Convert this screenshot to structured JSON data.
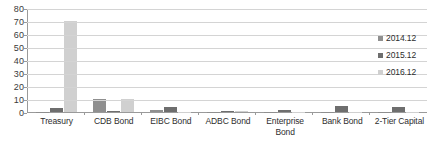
{
  "chart_data": {
    "type": "bar",
    "title": "",
    "subtitle": "",
    "xlabel": "",
    "ylabel": "",
    "ylim": [
      0,
      80
    ],
    "ytick_step": 10,
    "yticks": [
      "0",
      "10",
      "20",
      "30",
      "40",
      "50",
      "60",
      "70",
      "80"
    ],
    "grid": true,
    "legend_position": "right",
    "categories": [
      "Treasury",
      "CDB Bond",
      "EIBC Bond",
      "ADBC Bond",
      "Enterprise Bond",
      "Bank Bond",
      "2-Tier Capital"
    ],
    "series": [
      {
        "name": "2014.12",
        "color": "#8f8f8f",
        "values": [
          0.3,
          9.8,
          1.6,
          0.3,
          0.1,
          0.3,
          0.2
        ]
      },
      {
        "name": "2015.12",
        "color": "#6e6e6e",
        "values": [
          2.8,
          0.4,
          4.0,
          1.0,
          1.2,
          4.6,
          3.5
        ]
      },
      {
        "name": "2016.12",
        "color": "#d0d0d0",
        "values": [
          69.8,
          9.9,
          0.2,
          0.5,
          0.1,
          0.2,
          0.2
        ]
      }
    ]
  },
  "colors": {
    "axis": "#9a9a9a",
    "grid": "#d4d4d4",
    "text": "#2d2d2d",
    "background": "#ffffff"
  }
}
